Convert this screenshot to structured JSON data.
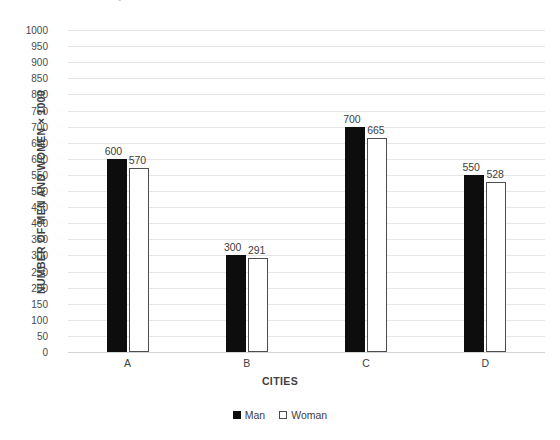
{
  "chart_data": {
    "type": "bar",
    "title": "The result of a survey of men and women in four cities",
    "title_clipped": true,
    "xlabel": "CITIES",
    "ylabel": "NUMBER OF MEN AND WOMEN × 1000",
    "categories": [
      "A",
      "B",
      "C",
      "D"
    ],
    "series": [
      {
        "name": "Man",
        "values": [
          600,
          300,
          700,
          550
        ]
      },
      {
        "name": "Woman",
        "values": [
          570,
          291,
          665,
          528
        ]
      }
    ],
    "ylim": [
      0,
      1000
    ],
    "ytick_step": 50,
    "yticks": [
      1000,
      950,
      900,
      850,
      800,
      750,
      700,
      650,
      600,
      550,
      500,
      450,
      400,
      350,
      300,
      250,
      200,
      150,
      100,
      50,
      0
    ],
    "grid": true,
    "legend_position": "bottom",
    "colors": {
      "man": "#0d0d0d",
      "woman": "#ffffff",
      "woman_border": "#4d4d4d",
      "gridline": "#e6e6e6",
      "axis": "#d4d4d4",
      "text": "#404040"
    }
  },
  "legend": {
    "items": [
      {
        "label": "Man",
        "marker": "filled-square"
      },
      {
        "label": "Woman",
        "marker": "outlined-square"
      }
    ]
  }
}
